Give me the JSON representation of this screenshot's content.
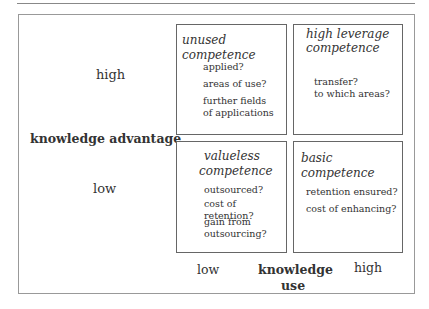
{
  "diagram": {
    "y_axis": {
      "label": "knowledge advantage",
      "high": "high",
      "low": "low"
    },
    "x_axis": {
      "label_line1": "knowledge",
      "label_line2": "use",
      "low": "low",
      "high": "high"
    },
    "quadrants": [
      {
        "position": "top-left",
        "title": "unused competence",
        "items": [
          "applied?",
          "areas of use?",
          "further fields",
          "of applications"
        ]
      },
      {
        "position": "top-right",
        "title_line1": "high leverage",
        "title_line2": "competence",
        "items": [
          "transfer?",
          "to which areas?"
        ]
      },
      {
        "position": "bottom-left",
        "title_line1": "valueless",
        "title_line2": "competence",
        "items": [
          "outsourced?",
          "cost of retention?",
          "gain from",
          "outsourcing?"
        ]
      },
      {
        "position": "bottom-right",
        "title": "basic competence",
        "items": [
          "retention ensured?",
          "cost of enhancing?"
        ]
      }
    ]
  }
}
